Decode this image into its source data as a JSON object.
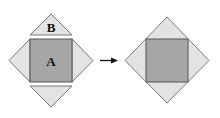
{
  "diagram": {
    "left_figure": {
      "square_label": "A",
      "triangle_label": "B"
    },
    "arrow": {
      "direction": "right"
    },
    "colors": {
      "square_fill": "#a6a6a6",
      "triangle_fill": "#e3e3e3",
      "outline": "#7a7a7a",
      "text": "#111111"
    }
  }
}
